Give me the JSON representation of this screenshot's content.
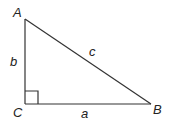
{
  "diagram": {
    "type": "right-triangle",
    "colors": {
      "stroke": "#333333",
      "text": "#222222",
      "background": "#ffffff"
    },
    "vertices": [
      {
        "id": "A",
        "label": "A",
        "x": 25,
        "y": 19,
        "label_x": 13,
        "label_y": 17
      },
      {
        "id": "B",
        "label": "B",
        "x": 151,
        "y": 104,
        "label_x": 153,
        "label_y": 114
      },
      {
        "id": "C",
        "label": "C",
        "x": 25,
        "y": 104,
        "label_x": 13,
        "label_y": 117
      }
    ],
    "sides": [
      {
        "id": "a",
        "label": "a",
        "from": "C",
        "to": "B",
        "label_x": 81,
        "label_y": 118
      },
      {
        "id": "b",
        "label": "b",
        "from": "A",
        "to": "C",
        "label_x": 10,
        "label_y": 66
      },
      {
        "id": "c",
        "label": "c",
        "from": "A",
        "to": "B",
        "label_x": 89,
        "label_y": 56
      }
    ],
    "right_angle_marker": {
      "at": "C",
      "size": 13
    }
  }
}
